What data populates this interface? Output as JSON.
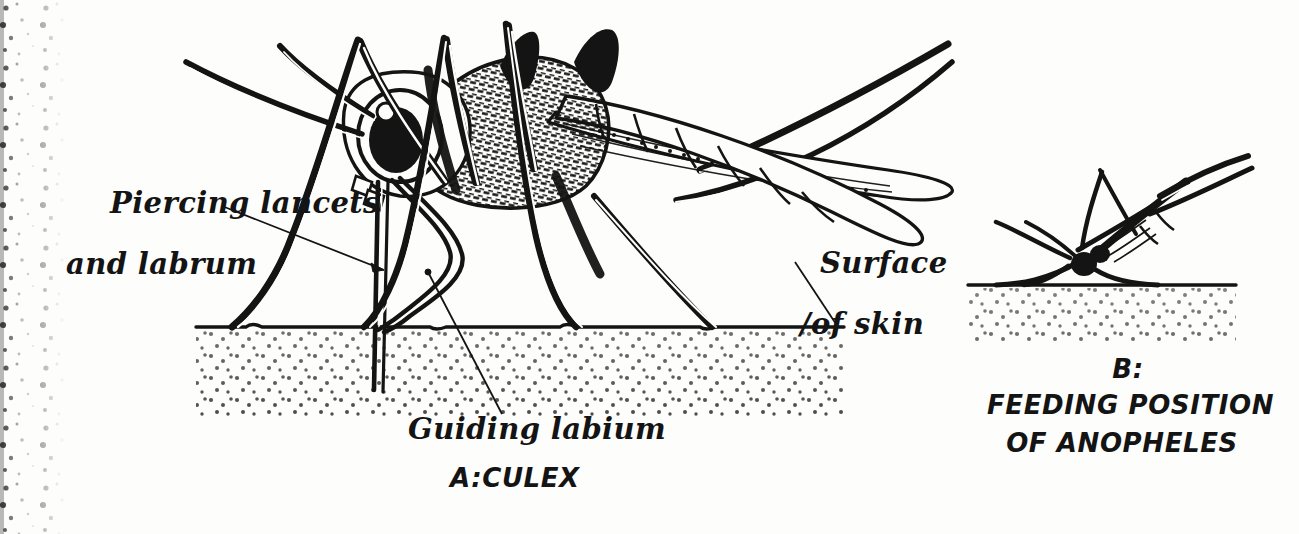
{
  "figure": {
    "title_a": "A:CULEX",
    "title_b_letter": "B:",
    "title_b_line1": "FEEDING POSITION",
    "title_b_line2": "OF ANOPHELES",
    "labels": {
      "piercing_line1": "Piercing lancets",
      "piercing_line2": "and labrum",
      "guiding": "Guiding labium",
      "surface_line1": "Surface",
      "surface_line2": "/of skin"
    },
    "colors": {
      "ink": "#141414",
      "paper": "#fdfdfb",
      "stipple": "#1a1a1a",
      "edge_speckle": "#2a2a2a"
    },
    "panels": [
      {
        "id": "A",
        "subject": "Culex mosquito piercing skin",
        "caption": "A:CULEX"
      },
      {
        "id": "B",
        "subject": "Anopheles mosquito feeding position",
        "caption": "B: FEEDING POSITION OF ANOPHELES"
      }
    ]
  }
}
